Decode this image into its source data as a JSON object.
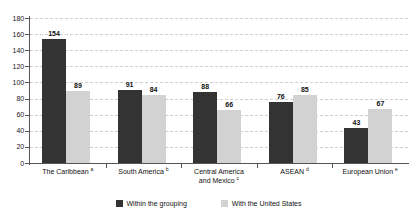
{
  "chart_data": {
    "type": "bar",
    "title": "",
    "xlabel": "",
    "ylabel": "",
    "ylim": [
      0,
      180
    ],
    "yticks": [
      0,
      20,
      40,
      60,
      80,
      100,
      120,
      140,
      160,
      180
    ],
    "grid": true,
    "legend_position": "bottom-center",
    "categories": [
      "The Caribbean",
      "South America",
      "Central America and Mexico",
      "ASEAN",
      "European Union"
    ],
    "category_labels": [
      {
        "line1": "The Caribbean",
        "line2": "",
        "note": "a"
      },
      {
        "line1": "South America",
        "line2": "",
        "note": "b"
      },
      {
        "line1": "Central America",
        "line2": "and Mexico",
        "note": "c"
      },
      {
        "line1": "ASEAN",
        "line2": "",
        "note": "d"
      },
      {
        "line1": "European Union",
        "line2": "",
        "note": "e"
      }
    ],
    "series": [
      {
        "name": "Within the grouping",
        "color": "#333333",
        "values": [
          154,
          91,
          88,
          76,
          43
        ]
      },
      {
        "name": "With the United States",
        "color": "#d2d2d2",
        "values": [
          89,
          84,
          66,
          85,
          67
        ]
      }
    ]
  },
  "legend": {
    "items": [
      {
        "label": "Within the grouping",
        "color": "#333333"
      },
      {
        "label": "With the United States",
        "color": "#d2d2d2"
      }
    ]
  }
}
